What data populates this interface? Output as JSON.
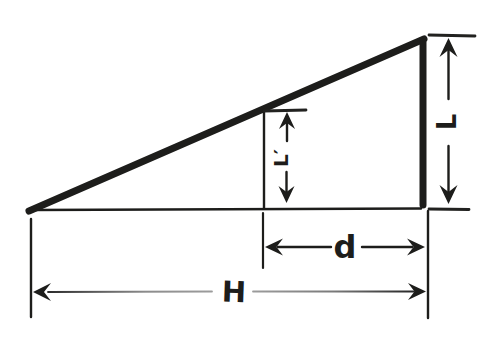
{
  "figure": {
    "kind": "hand-drawn right-triangle dimension diagram",
    "background_color": "#ffffff",
    "ink_color": "#1d1d1b",
    "labels": {
      "full_height": "L",
      "partial_height": "L′",
      "horizontal_near": "d",
      "horizontal_full": "H"
    }
  }
}
